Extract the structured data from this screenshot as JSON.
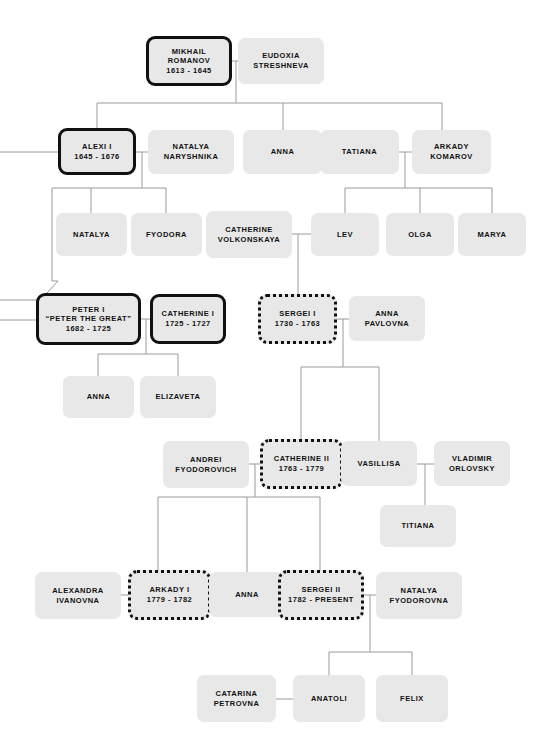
{
  "diagram": {
    "legend": {
      "solid_border": "ruling monarch",
      "dotted_border": "later ruling monarch",
      "plain": "family member"
    },
    "colors": {
      "node_fill": "#e8e8e8",
      "border": "#111111",
      "line": "#9a9a9a",
      "text": "#111111",
      "background": "#ffffff"
    }
  },
  "nodes": [
    {
      "id": "mikhail",
      "style": "ruler",
      "lines": [
        "MIKHAIL",
        "ROMANOV",
        "1613 - 1645"
      ],
      "x": 146,
      "y": 36,
      "w": 86,
      "h": 50,
      "fs": 7.5
    },
    {
      "id": "eudoxia",
      "style": "plain",
      "lines": [
        "EUDOXIA",
        "STRESHNEVA"
      ],
      "x": 238,
      "y": 38,
      "w": 86,
      "h": 46,
      "fs": 7.5
    },
    {
      "id": "alexi1",
      "style": "ruler",
      "lines": [
        "ALEXI I",
        "1645 - 1676"
      ],
      "x": 58,
      "y": 128,
      "w": 78,
      "h": 47,
      "fs": 7.5
    },
    {
      "id": "natalyaN",
      "style": "plain",
      "lines": [
        "NATALYA",
        "NARYSHNIKA"
      ],
      "x": 148,
      "y": 130,
      "w": 86,
      "h": 44,
      "fs": 7.5
    },
    {
      "id": "anna_r2",
      "style": "plain",
      "lines": [
        "ANNA"
      ],
      "x": 243,
      "y": 130,
      "w": 79,
      "h": 44,
      "fs": 7.5
    },
    {
      "id": "tatiana",
      "style": "plain",
      "lines": [
        "TATIANA"
      ],
      "x": 320,
      "y": 130,
      "w": 79,
      "h": 44,
      "fs": 7.5
    },
    {
      "id": "arkadyK",
      "style": "plain",
      "lines": [
        "ARKADY",
        "KOMAROV"
      ],
      "x": 412,
      "y": 130,
      "w": 79,
      "h": 44,
      "fs": 7.5
    },
    {
      "id": "natalya_r3",
      "style": "plain",
      "lines": [
        "NATALYA"
      ],
      "x": 56,
      "y": 213,
      "w": 71,
      "h": 43,
      "fs": 7.5
    },
    {
      "id": "fyodora",
      "style": "plain",
      "lines": [
        "FYODORA"
      ],
      "x": 131,
      "y": 213,
      "w": 71,
      "h": 43,
      "fs": 7.5
    },
    {
      "id": "catherineV",
      "style": "plain",
      "lines": [
        "CATHERINE",
        "VOLKONSKAYA"
      ],
      "x": 206,
      "y": 211,
      "w": 86,
      "h": 47,
      "fs": 7.5
    },
    {
      "id": "lev",
      "style": "plain",
      "lines": [
        "LEV"
      ],
      "x": 311,
      "y": 213,
      "w": 68,
      "h": 43,
      "fs": 7.5
    },
    {
      "id": "olga",
      "style": "plain",
      "lines": [
        "OLGA"
      ],
      "x": 386,
      "y": 213,
      "w": 68,
      "h": 43,
      "fs": 7.5
    },
    {
      "id": "marya",
      "style": "plain",
      "lines": [
        "MARYA"
      ],
      "x": 458,
      "y": 213,
      "w": 68,
      "h": 43,
      "fs": 7.5
    },
    {
      "id": "peter1",
      "style": "ruler",
      "lines": [
        "PETER I",
        "“PETER THE GREAT”",
        "1682 - 1725"
      ],
      "x": 36,
      "y": 293,
      "w": 105,
      "h": 52,
      "fs": 7.5
    },
    {
      "id": "catherine1",
      "style": "ruler",
      "lines": [
        "CATHERINE I",
        "1725 - 1727"
      ],
      "x": 150,
      "y": 294,
      "w": 76,
      "h": 50,
      "fs": 7.5
    },
    {
      "id": "sergei1",
      "style": "dotted",
      "lines": [
        "SERGEI I",
        "1730 - 1763"
      ],
      "x": 258,
      "y": 294,
      "w": 79,
      "h": 50,
      "fs": 7.5
    },
    {
      "id": "annaP",
      "style": "plain",
      "lines": [
        "ANNA",
        "PAVLOVNA"
      ],
      "x": 349,
      "y": 296,
      "w": 76,
      "h": 45,
      "fs": 7.5
    },
    {
      "id": "anna_r5",
      "style": "plain",
      "lines": [
        "ANNA"
      ],
      "x": 63,
      "y": 376,
      "w": 71,
      "h": 42,
      "fs": 7.5
    },
    {
      "id": "elizaveta",
      "style": "plain",
      "lines": [
        "ELIZAVETA"
      ],
      "x": 140,
      "y": 376,
      "w": 76,
      "h": 42,
      "fs": 7.5
    },
    {
      "id": "andreiF",
      "style": "plain",
      "lines": [
        "ANDREI",
        "FYODOROVICH"
      ],
      "x": 163,
      "y": 441,
      "w": 86,
      "h": 47,
      "fs": 7.5
    },
    {
      "id": "catherine2",
      "style": "dotted",
      "lines": [
        "CATHERINE II",
        "1763 - 1779"
      ],
      "x": 260,
      "y": 439,
      "w": 83,
      "h": 50,
      "fs": 7.5
    },
    {
      "id": "vasillisa",
      "style": "plain",
      "lines": [
        "VASILLISA"
      ],
      "x": 341,
      "y": 441,
      "w": 76,
      "h": 45,
      "fs": 7.5
    },
    {
      "id": "vladimirO",
      "style": "plain",
      "lines": [
        "VLADIMIR",
        "ORLOVSKY"
      ],
      "x": 434,
      "y": 441,
      "w": 76,
      "h": 45,
      "fs": 7.5
    },
    {
      "id": "titiana",
      "style": "plain",
      "lines": [
        "TITIANA"
      ],
      "x": 380,
      "y": 505,
      "w": 76,
      "h": 42,
      "fs": 7.5
    },
    {
      "id": "alexandraI",
      "style": "plain",
      "lines": [
        "ALEXANDRA",
        "IVANOVNA"
      ],
      "x": 35,
      "y": 572,
      "w": 86,
      "h": 47,
      "fs": 7.5
    },
    {
      "id": "arkady1",
      "style": "dotted",
      "lines": [
        "ARKADY I",
        "1779 - 1782"
      ],
      "x": 128,
      "y": 570,
      "w": 83,
      "h": 50,
      "fs": 7.5
    },
    {
      "id": "anna_r7",
      "style": "plain",
      "lines": [
        "ANNA"
      ],
      "x": 209,
      "y": 572,
      "w": 76,
      "h": 45,
      "fs": 7.5
    },
    {
      "id": "sergei2",
      "style": "dotted",
      "lines": [
        "SERGEI II",
        "1782 - PRESENT"
      ],
      "x": 278,
      "y": 570,
      "w": 86,
      "h": 50,
      "fs": 7.5
    },
    {
      "id": "natalyaF",
      "style": "plain",
      "lines": [
        "NATALYA",
        "FYODOROVNA"
      ],
      "x": 376,
      "y": 572,
      "w": 86,
      "h": 47,
      "fs": 7.5
    },
    {
      "id": "catarinaP",
      "style": "plain",
      "lines": [
        "CATARINA",
        "PETROVNA"
      ],
      "x": 197,
      "y": 675,
      "w": 79,
      "h": 47,
      "fs": 7.5
    },
    {
      "id": "anatoli",
      "style": "plain",
      "lines": [
        "ANATOLI"
      ],
      "x": 293,
      "y": 675,
      "w": 72,
      "h": 47,
      "fs": 7.5
    },
    {
      "id": "felix",
      "style": "plain",
      "lines": [
        "FELIX"
      ],
      "x": 376,
      "y": 675,
      "w": 72,
      "h": 47,
      "fs": 7.5
    }
  ],
  "connectors": [
    {
      "id": "mikhail-eudoxia-union",
      "d": "M232,61 H238"
    },
    {
      "id": "mikhail-children-stem",
      "d": "M236,61 V103"
    },
    {
      "id": "mikhail-children-bar",
      "d": "M97,103 H442"
    },
    {
      "id": "drop-alexi1",
      "d": "M97,103 V128"
    },
    {
      "id": "drop-anna-r2",
      "d": "M283,103 V130"
    },
    {
      "id": "drop-arkady-komarov",
      "d": "M442,103 V130"
    },
    {
      "id": "alexi-left-in",
      "d": "M0,152 H58"
    },
    {
      "id": "alexi-natalya-union",
      "d": "M136,152 H148"
    },
    {
      "id": "alexi-children-stem",
      "d": "M142,152 V188"
    },
    {
      "id": "alexi-children-bar",
      "d": "M52,188 H166"
    },
    {
      "id": "drop-natalya-r3",
      "d": "M91,188 V213"
    },
    {
      "id": "drop-fyodora",
      "d": "M166,188 V213"
    },
    {
      "id": "alexi-left-down",
      "d": "M52,188 V281"
    },
    {
      "id": "alexi-to-peter",
      "d": "M52,281 H58 L36,305"
    },
    {
      "id": "tatiana-arkady-union",
      "d": "M399,152 H412"
    },
    {
      "id": "tatiana-children-stem",
      "d": "M405,152 V188"
    },
    {
      "id": "tatiana-children-bar",
      "d": "M345,188 H492"
    },
    {
      "id": "drop-lev",
      "d": "M345,188 V213"
    },
    {
      "id": "drop-olga",
      "d": "M420,188 V213"
    },
    {
      "id": "drop-marya",
      "d": "M492,188 V213"
    },
    {
      "id": "catherineV-lev-union",
      "d": "M292,234 H311"
    },
    {
      "id": "sergei1-stem",
      "d": "M298,234 V294"
    },
    {
      "id": "peter-left-in-a",
      "d": "M0,300 H36"
    },
    {
      "id": "peter-left-in-b",
      "d": "M0,320 H36"
    },
    {
      "id": "peter-catherine-union",
      "d": "M141,319 H150"
    },
    {
      "id": "peter-children-stem",
      "d": "M146,319 V354"
    },
    {
      "id": "peter-children-bar",
      "d": "M98,354 H178"
    },
    {
      "id": "drop-anna-r5",
      "d": "M98,354 V376"
    },
    {
      "id": "drop-elizaveta",
      "d": "M178,354 V376"
    },
    {
      "id": "sergei1-anna-union",
      "d": "M337,319 H349"
    },
    {
      "id": "sergei1-children-stem",
      "d": "M343,319 V367"
    },
    {
      "id": "sergei1-children-bar",
      "d": "M301,367 H379"
    },
    {
      "id": "drop-catherine2",
      "d": "M301,367 V439"
    },
    {
      "id": "drop-vasillisa",
      "d": "M379,367 V441"
    },
    {
      "id": "andrei-cath2-union",
      "d": "M249,464 H260"
    },
    {
      "id": "cath2-children-stem",
      "d": "M255,464 V497"
    },
    {
      "id": "cath2-children-bar",
      "d": "M158,497 H320"
    },
    {
      "id": "drop-arkady1",
      "d": "M158,497 V570"
    },
    {
      "id": "drop-anna-r7",
      "d": "M247,497 V572"
    },
    {
      "id": "drop-sergei2",
      "d": "M320,497 V570"
    },
    {
      "id": "vasillisa-vladimir-union",
      "d": "M417,464 H434"
    },
    {
      "id": "titiana-stem",
      "d": "M425,464 V505"
    },
    {
      "id": "alexandra-arkady1-union",
      "d": "M121,595 H128"
    },
    {
      "id": "sergei2-natalya-union",
      "d": "M364,595 H376"
    },
    {
      "id": "sergei2-children-stem",
      "d": "M370,595 V652"
    },
    {
      "id": "sergei2-children-bar",
      "d": "M329,652 H412"
    },
    {
      "id": "drop-anatoli",
      "d": "M329,652 V675"
    },
    {
      "id": "drop-felix",
      "d": "M412,652 V675"
    },
    {
      "id": "catarina-anatoli-union",
      "d": "M276,699 H293"
    }
  ]
}
